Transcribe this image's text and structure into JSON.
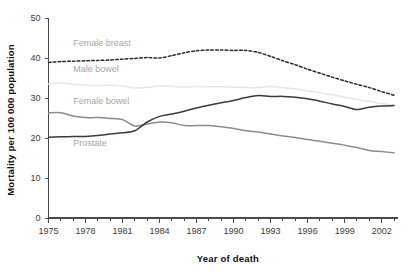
{
  "chart_data": {
    "type": "line",
    "title": "",
    "xlabel": "Year of death",
    "ylabel": "Mortality per 100 000 population",
    "xlim": [
      1975,
      2003
    ],
    "ylim": [
      0,
      50
    ],
    "ytick_values": [
      0,
      10,
      20,
      30,
      40,
      50
    ],
    "ytick_labels": [
      "0",
      "10",
      "20",
      "30",
      "40",
      "50"
    ],
    "xtick_labels": [
      "1975",
      "1978",
      "1981",
      "1984",
      "1987",
      "1990",
      "1993",
      "1996",
      "1999",
      "2002"
    ],
    "xtick_values": [
      1975,
      1978,
      1981,
      1984,
      1987,
      1990,
      1993,
      1996,
      1999,
      2002
    ],
    "minor_xticks_every": 1,
    "grid": false,
    "legend": "inline-labels",
    "x": [
      1975,
      1976,
      1977,
      1978,
      1979,
      1980,
      1981,
      1982,
      1983,
      1984,
      1985,
      1986,
      1987,
      1988,
      1989,
      1990,
      1991,
      1992,
      1993,
      1994,
      1995,
      1996,
      1997,
      1998,
      1999,
      2000,
      2001,
      2002,
      2003
    ],
    "series": [
      {
        "name": "Female breast",
        "style": "dashed",
        "color": "#2b2b2b",
        "label_x": 1977.0,
        "label_y": 43.0,
        "values": [
          38.9,
          39.1,
          39.2,
          39.3,
          39.4,
          39.5,
          39.7,
          39.9,
          40.1,
          40.0,
          40.6,
          41.3,
          41.8,
          42.0,
          42.0,
          41.9,
          41.9,
          41.4,
          40.4,
          39.3,
          38.3,
          37.2,
          36.2,
          35.2,
          34.3,
          33.4,
          32.6,
          31.6,
          30.7
        ]
      },
      {
        "name": "Male bowel",
        "style": "solid",
        "color": "#e6e6e6",
        "label_x": 1977.0,
        "label_y": 36.6,
        "values": [
          33.5,
          33.8,
          33.4,
          33.2,
          33.1,
          33.2,
          33.0,
          32.5,
          32.6,
          33.0,
          32.9,
          32.7,
          32.9,
          32.8,
          32.8,
          32.7,
          32.6,
          32.6,
          32.9,
          32.6,
          32.3,
          31.8,
          31.3,
          30.8,
          30.2,
          29.6,
          29.2,
          28.6,
          28.2
        ]
      },
      {
        "name": "Female bowel",
        "style": "solid",
        "color": "#8c8c8c",
        "label_x": 1977.0,
        "label_y": 28.6,
        "values": [
          26.3,
          26.3,
          25.5,
          25.1,
          25.1,
          24.9,
          24.6,
          23.0,
          23.5,
          24.0,
          23.8,
          23.1,
          23.1,
          23.1,
          22.8,
          22.4,
          21.8,
          21.5,
          21.0,
          20.5,
          20.1,
          19.6,
          19.2,
          18.7,
          18.2,
          17.6,
          16.9,
          16.6,
          16.3
        ]
      },
      {
        "name": "Prostate",
        "style": "solid",
        "color": "#3b3b3b",
        "label_x": 1977.0,
        "label_y": 18.1,
        "values": [
          20.2,
          20.3,
          20.4,
          20.4,
          20.6,
          21.0,
          21.3,
          21.8,
          24.0,
          25.4,
          26.0,
          26.7,
          27.5,
          28.2,
          28.8,
          29.4,
          30.1,
          30.6,
          30.4,
          30.4,
          30.2,
          29.8,
          29.2,
          28.5,
          27.9,
          27.1,
          27.7,
          28.0,
          28.1
        ]
      }
    ]
  }
}
